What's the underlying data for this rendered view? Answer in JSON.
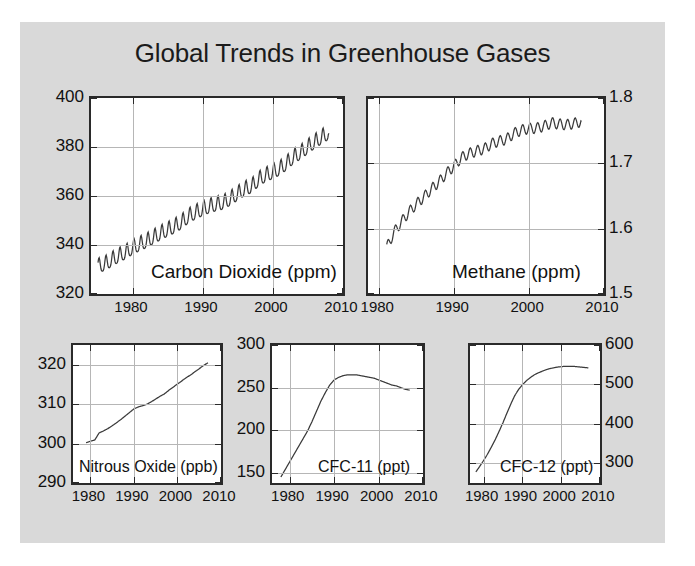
{
  "figure": {
    "title": "Global Trends in Greenhouse Gases",
    "background_color": "#d9d9d9",
    "plot_background_color": "#ffffff",
    "line_color": "#3a3a3a",
    "grid_color": "#b6b6b6",
    "axis_color": "#2a2a2a"
  },
  "panels": {
    "co2": {
      "label": "Carbon Dioxide (ppm)",
      "y_ticks": [
        "320",
        "340",
        "360",
        "380",
        "400"
      ],
      "x_ticks": [
        "1980",
        "1990",
        "2000",
        "2010"
      ],
      "y_axis_side": "left"
    },
    "ch4": {
      "label": "Methane (ppm)",
      "y_ticks": [
        "1.5",
        "1.6",
        "1.7",
        "1.8"
      ],
      "x_ticks": [
        "1980",
        "1990",
        "2000",
        "2010"
      ],
      "y_axis_side": "right"
    },
    "n2o": {
      "label": "Nitrous Oxide (ppb)",
      "y_ticks": [
        "290",
        "300",
        "310",
        "320"
      ],
      "x_ticks": [
        "1980",
        "1990",
        "2000",
        "2010"
      ],
      "y_axis_side": "left"
    },
    "cfc11": {
      "label": "CFC-11 (ppt)",
      "y_ticks": [
        "150",
        "200",
        "250",
        "300"
      ],
      "x_ticks": [
        "1980",
        "1990",
        "2000",
        "2010"
      ],
      "y_axis_side": "left"
    },
    "cfc12": {
      "label": "CFC-12 (ppt)",
      "y_ticks": [
        "300",
        "400",
        "500",
        "600"
      ],
      "x_ticks": [
        "1980",
        "1990",
        "2000",
        "2010"
      ],
      "y_axis_side": "right"
    }
  },
  "chart_data": [
    {
      "id": "co2",
      "type": "line",
      "title": "Carbon Dioxide (ppm)",
      "xlabel": "",
      "ylabel": "Carbon Dioxide (ppm)",
      "xlim": [
        1974.0,
        2010.0
      ],
      "ylim": [
        320,
        400
      ],
      "yticks": [
        320,
        340,
        360,
        380,
        400
      ],
      "xticks": [
        1980,
        1990,
        2000,
        2010
      ],
      "grid": true,
      "seasonal_cycle": true,
      "seasonal_amplitude_ppm": 3.0,
      "x": [
        1975,
        1976,
        1977,
        1978,
        1979,
        1980,
        1981,
        1982,
        1983,
        1984,
        1985,
        1986,
        1987,
        1988,
        1989,
        1990,
        1991,
        1992,
        1993,
        1994,
        1995,
        1996,
        1997,
        1998,
        1999,
        2000,
        2001,
        2002,
        2003,
        2004,
        2005,
        2006,
        2007,
        2008
      ],
      "values": [
        331.1,
        332.0,
        333.8,
        335.4,
        336.8,
        338.7,
        340.1,
        341.4,
        343.0,
        344.6,
        346.0,
        347.4,
        349.2,
        351.6,
        353.1,
        354.4,
        355.6,
        356.4,
        357.1,
        358.8,
        360.8,
        362.6,
        363.8,
        366.6,
        368.3,
        369.5,
        371.0,
        373.2,
        375.8,
        377.5,
        379.8,
        381.9,
        383.8,
        385.6
      ]
    },
    {
      "id": "ch4",
      "type": "line",
      "title": "Methane (ppm)",
      "xlabel": "",
      "ylabel": "Methane (ppm)",
      "xlim": [
        1978.5,
        2010.0
      ],
      "ylim": [
        1.5,
        1.8
      ],
      "yticks": [
        1.5,
        1.6,
        1.7,
        1.8
      ],
      "xticks": [
        1980,
        1990,
        2000,
        2010
      ],
      "grid": true,
      "seasonal_cycle": true,
      "seasonal_amplitude_ppm": 0.008,
      "x": [
        1981,
        1982,
        1983,
        1984,
        1985,
        1986,
        1987,
        1988,
        1989,
        1990,
        1991,
        1992,
        1993,
        1994,
        1995,
        1996,
        1997,
        1998,
        1999,
        2000,
        2001,
        2002,
        2003,
        2004,
        2005,
        2006,
        2007
      ],
      "values": [
        1.571,
        1.595,
        1.611,
        1.626,
        1.638,
        1.649,
        1.661,
        1.672,
        1.685,
        1.696,
        1.709,
        1.715,
        1.719,
        1.722,
        1.73,
        1.734,
        1.737,
        1.746,
        1.751,
        1.753,
        1.754,
        1.757,
        1.762,
        1.76,
        1.759,
        1.761,
        1.764
      ]
    },
    {
      "id": "n2o",
      "type": "line",
      "title": "Nitrous Oxide (ppb)",
      "xlabel": "",
      "ylabel": "Nitrous Oxide (ppb)",
      "xlim": [
        1976.0,
        2010.0
      ],
      "ylim": [
        290,
        325
      ],
      "yticks": [
        290,
        300,
        310,
        320
      ],
      "xticks": [
        1980,
        1990,
        2000,
        2010
      ],
      "grid": true,
      "x": [
        1979,
        1980,
        1981,
        1982,
        1983,
        1984,
        1985,
        1986,
        1987,
        1988,
        1989,
        1990,
        1991,
        1992,
        1993,
        1994,
        1995,
        1996,
        1997,
        1998,
        1999,
        2000,
        2001,
        2002,
        2003,
        2004,
        2005,
        2006,
        2007
      ],
      "values": [
        300.2,
        300.6,
        300.9,
        302.7,
        303.2,
        303.8,
        304.5,
        305.3,
        306.1,
        307.0,
        307.9,
        308.8,
        309.3,
        309.6,
        310.0,
        310.6,
        311.3,
        312.0,
        312.6,
        313.5,
        314.3,
        315.1,
        315.9,
        316.7,
        317.4,
        318.2,
        319.0,
        319.8,
        320.5
      ]
    },
    {
      "id": "cfc11",
      "type": "line",
      "title": "CFC-11 (ppt)",
      "xlabel": "",
      "ylabel": "CFC-11 (ppt)",
      "xlim": [
        1976.0,
        2010.0
      ],
      "ylim": [
        138,
        300
      ],
      "yticks": [
        150,
        200,
        250,
        300
      ],
      "xticks": [
        1980,
        1990,
        2000,
        2010
      ],
      "grid": true,
      "x": [
        1978,
        1979,
        1980,
        1981,
        1982,
        1983,
        1984,
        1985,
        1986,
        1987,
        1988,
        1989,
        1990,
        1991,
        1992,
        1993,
        1994,
        1995,
        1996,
        1997,
        1998,
        1999,
        2000,
        2001,
        2002,
        2003,
        2004,
        2005,
        2006,
        2007
      ],
      "values": [
        145,
        154,
        163,
        172,
        181,
        190,
        199,
        210,
        222,
        234,
        244,
        253,
        259,
        262,
        264,
        265,
        265,
        265,
        264,
        263,
        262,
        261,
        259,
        257,
        255,
        253,
        252,
        250,
        248,
        247
      ]
    },
    {
      "id": "cfc12",
      "type": "line",
      "title": "CFC-12 (ppt)",
      "xlabel": "",
      "ylabel": "CFC-12 (ppt)",
      "xlim": [
        1976.5,
        2010.0
      ],
      "ylim": [
        250,
        600
      ],
      "yticks": [
        300,
        400,
        500,
        600
      ],
      "xticks": [
        1980,
        1990,
        2000,
        2010
      ],
      "grid": true,
      "x": [
        1978,
        1979,
        1980,
        1981,
        1982,
        1983,
        1984,
        1985,
        1986,
        1987,
        1988,
        1989,
        1990,
        1991,
        1992,
        1993,
        1994,
        1995,
        1996,
        1997,
        1998,
        1999,
        2000,
        2001,
        2002,
        2003,
        2004,
        2005,
        2006,
        2007
      ],
      "values": [
        278,
        292,
        307,
        323,
        341,
        360,
        381,
        403,
        427,
        450,
        471,
        487,
        499,
        509,
        517,
        524,
        529,
        533,
        537,
        540,
        542,
        544,
        545,
        546,
        546,
        546,
        545,
        544,
        543,
        542
      ]
    }
  ]
}
